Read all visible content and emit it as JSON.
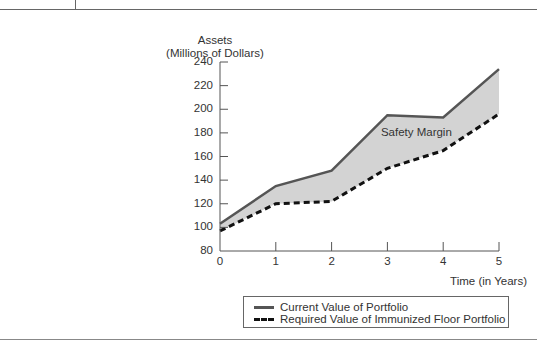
{
  "chart_data": {
    "type": "area",
    "title": "",
    "xlabel": "Time (in Years)",
    "ylabel": "Assets (Millions of Dollars)",
    "ylabel_lines": [
      "Assets",
      "(Millions of Dollars)"
    ],
    "x": [
      0,
      1,
      2,
      3,
      4,
      5
    ],
    "xticks": [
      "0",
      "1",
      "2",
      "3",
      "4",
      "5"
    ],
    "yticks": [
      "80",
      "100",
      "120",
      "140",
      "160",
      "180",
      "200",
      "220",
      "240"
    ],
    "ylim": [
      80,
      240
    ],
    "xlim": [
      0,
      5
    ],
    "grid": false,
    "legend_position": "bottom-right",
    "series": [
      {
        "name": "Current Value of Portfolio",
        "style": "solid",
        "color": "#555555",
        "values": [
          103,
          135,
          148,
          195,
          193,
          234
        ]
      },
      {
        "name": "Required Value of Immunized Floor Portfolio",
        "style": "dashed",
        "color": "#111111",
        "values": [
          97,
          120,
          122,
          150,
          165,
          196
        ]
      }
    ],
    "fill_between": {
      "label": "Safety Margin",
      "color": "#d3d3d3"
    },
    "annotations": [
      {
        "text": "Safety Margin",
        "x": 3.6,
        "y": 180
      }
    ]
  }
}
